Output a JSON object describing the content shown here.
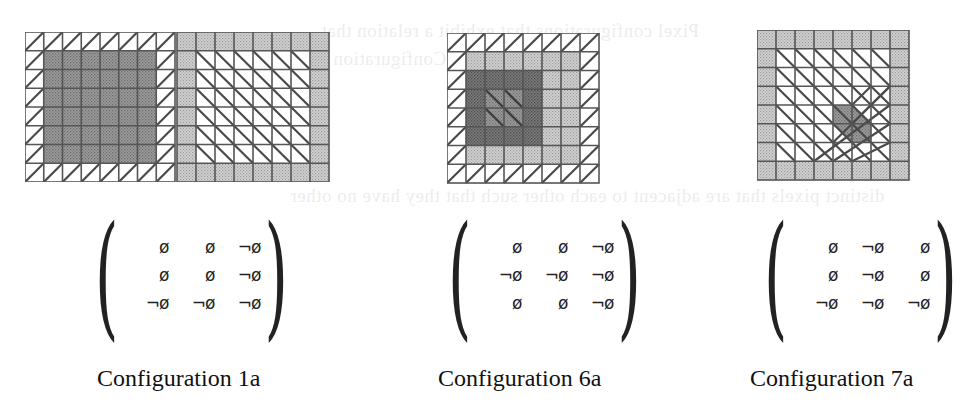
{
  "background_text": [
    "Pixel configurations that exhibit a relation that ...",
    "(Configuration 1) ...",
    "distinct pixels that are adjacent to each other such that they have no other"
  ],
  "figures": [
    {
      "id": "config-1a",
      "caption": "Configuration 1a",
      "grids": [
        {
          "cols": 8,
          "rows": 8,
          "outer": "hatch-forward",
          "inner": "dark-stipple",
          "inner_extent": [
            1,
            1,
            6,
            7
          ]
        },
        {
          "cols": 8,
          "rows": 8,
          "outer": "light-stipple",
          "inner": "hatch-back",
          "inner_extent": [
            1,
            1,
            7,
            7
          ]
        }
      ],
      "matrix": [
        [
          "ø",
          "ø",
          "¬ø"
        ],
        [
          "ø",
          "ø",
          "¬ø"
        ],
        [
          "¬ø",
          "¬ø",
          "¬ø"
        ]
      ]
    },
    {
      "id": "config-6a",
      "caption": "Configuration  6a",
      "grids": [
        {
          "cols": 8,
          "rows": 8,
          "outer": "hatch-forward",
          "middle": "light-stipple",
          "inner": "dark-stipple",
          "core": "hatch-back-on-stipple"
        }
      ],
      "matrix": [
        [
          "ø",
          "ø",
          "¬ø"
        ],
        [
          "¬ø",
          "¬ø",
          "¬ø"
        ],
        [
          "ø",
          "ø",
          "¬ø"
        ]
      ]
    },
    {
      "id": "config-7a",
      "caption": "Configuration 7a",
      "grids": [
        {
          "cols": 8,
          "rows": 8,
          "outer": "light-stipple",
          "inner": "hatch-back-and-forward",
          "core": "dark-diagonal"
        }
      ],
      "matrix": [
        [
          "ø",
          "¬ø",
          "ø"
        ],
        [
          "ø",
          "¬ø",
          "ø"
        ],
        [
          "¬ø",
          "¬ø",
          "¬ø"
        ]
      ]
    }
  ],
  "colors": {
    "grid_line": "#555555",
    "light_stipple": "#c4c4c4",
    "dark_stipple": "#8e8e8e",
    "darkest": "#6a6a6a",
    "paper": "#ffffff"
  }
}
